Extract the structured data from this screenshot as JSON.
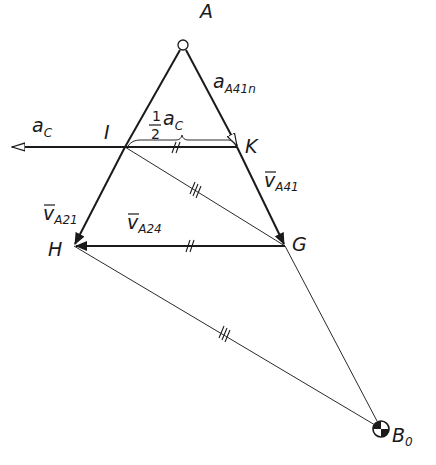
{
  "diagram": {
    "type": "velocity/acceleration polygon",
    "points": {
      "A": {
        "label": "A",
        "x": 183,
        "y": 45
      },
      "I": {
        "label": "I",
        "x": 125,
        "y": 147
      },
      "K": {
        "label": "K",
        "x": 237,
        "y": 147
      },
      "G": {
        "label": "G",
        "x": 285,
        "y": 246
      },
      "H": {
        "label": "H",
        "x": 74,
        "y": 246
      },
      "B0": {
        "label": "B",
        "sub": "0",
        "x": 381,
        "y": 429
      }
    },
    "labels": {
      "a_c": {
        "main": "a",
        "sub": "C"
      },
      "half_ac": {
        "num": "1",
        "den": "2",
        "main": "a",
        "sub": "C"
      },
      "a_A41n": {
        "main": "a",
        "sub": "A41n"
      },
      "v_A41": {
        "main": "v",
        "sub": "A41"
      },
      "v_A21": {
        "main": "v",
        "sub": "A21"
      },
      "v_A24": {
        "main": "v",
        "sub": "A24"
      }
    },
    "tick_marks": {
      "IK": "//",
      "HG": "//",
      "IG": "///",
      "HB0": "///"
    },
    "colors": {
      "ink": "#1a1a1a",
      "background": "#ffffff"
    }
  }
}
